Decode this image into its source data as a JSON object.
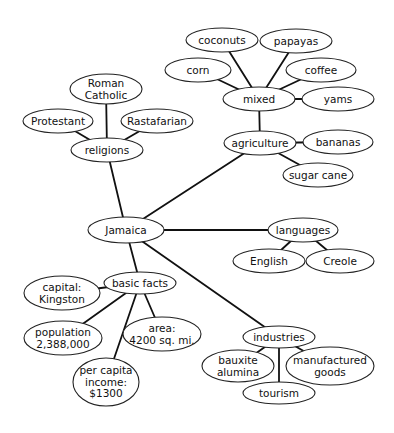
{
  "diagram": {
    "type": "concept-map",
    "root": "Jamaica",
    "nodes": [
      {
        "id": "jamaica",
        "lines": [
          "Jamaica"
        ],
        "cx": 126,
        "cy": 230,
        "rx": 38,
        "ry": 13
      },
      {
        "id": "religions",
        "lines": [
          "religions"
        ],
        "cx": 107,
        "cy": 150,
        "rx": 36,
        "ry": 12
      },
      {
        "id": "roman-catholic",
        "lines": [
          "Roman",
          "Catholic"
        ],
        "cx": 106,
        "cy": 89,
        "rx": 36,
        "ry": 15
      },
      {
        "id": "protestant",
        "lines": [
          "Protestant"
        ],
        "cx": 58,
        "cy": 121,
        "rx": 35,
        "ry": 12
      },
      {
        "id": "rastafarian",
        "lines": [
          "Rastafarian"
        ],
        "cx": 157,
        "cy": 121,
        "rx": 36,
        "ry": 12
      },
      {
        "id": "agriculture",
        "lines": [
          "agriculture"
        ],
        "cx": 260,
        "cy": 143,
        "rx": 36,
        "ry": 12
      },
      {
        "id": "mixed",
        "lines": [
          "mixed"
        ],
        "cx": 259,
        "cy": 99,
        "rx": 36,
        "ry": 12
      },
      {
        "id": "coconuts",
        "lines": [
          "coconuts"
        ],
        "cx": 222,
        "cy": 40,
        "rx": 36,
        "ry": 12
      },
      {
        "id": "papayas",
        "lines": [
          "papayas"
        ],
        "cx": 296,
        "cy": 41,
        "rx": 36,
        "ry": 12
      },
      {
        "id": "corn",
        "lines": [
          "corn"
        ],
        "cx": 198,
        "cy": 70,
        "rx": 33,
        "ry": 12
      },
      {
        "id": "coffee",
        "lines": [
          "coffee"
        ],
        "cx": 321,
        "cy": 70,
        "rx": 35,
        "ry": 12
      },
      {
        "id": "yams",
        "lines": [
          "yams"
        ],
        "cx": 338,
        "cy": 99,
        "rx": 36,
        "ry": 12
      },
      {
        "id": "bananas",
        "lines": [
          "bananas"
        ],
        "cx": 338,
        "cy": 142,
        "rx": 35,
        "ry": 12
      },
      {
        "id": "sugar-cane",
        "lines": [
          "sugar cane"
        ],
        "cx": 318,
        "cy": 175,
        "rx": 35,
        "ry": 12
      },
      {
        "id": "languages",
        "lines": [
          "languages"
        ],
        "cx": 303,
        "cy": 230,
        "rx": 35,
        "ry": 12
      },
      {
        "id": "english",
        "lines": [
          "English"
        ],
        "cx": 269,
        "cy": 261,
        "rx": 36,
        "ry": 12
      },
      {
        "id": "creole",
        "lines": [
          "Creole"
        ],
        "cx": 340,
        "cy": 261,
        "rx": 34,
        "ry": 12
      },
      {
        "id": "basic-facts",
        "lines": [
          "basic facts"
        ],
        "cx": 140,
        "cy": 283,
        "rx": 36,
        "ry": 11
      },
      {
        "id": "capital",
        "lines": [
          "capital:",
          "Kingston"
        ],
        "cx": 62,
        "cy": 293,
        "rx": 38,
        "ry": 17
      },
      {
        "id": "population",
        "lines": [
          "population",
          "2,388,000"
        ],
        "cx": 63,
        "cy": 338,
        "rx": 39,
        "ry": 17
      },
      {
        "id": "area",
        "lines": [
          "area:",
          "4200 sq. mi."
        ],
        "cx": 162,
        "cy": 334,
        "rx": 39,
        "ry": 17
      },
      {
        "id": "per-capita-income",
        "lines": [
          "per capita",
          "income:",
          "$1300"
        ],
        "cx": 106,
        "cy": 382,
        "rx": 33,
        "ry": 24
      },
      {
        "id": "industries",
        "lines": [
          "industries"
        ],
        "cx": 279,
        "cy": 337,
        "rx": 36,
        "ry": 11
      },
      {
        "id": "bauxite-alumina",
        "lines": [
          "bauxite",
          "alumina"
        ],
        "cx": 238,
        "cy": 366,
        "rx": 36,
        "ry": 16
      },
      {
        "id": "manufactured-goods",
        "lines": [
          "manufactured",
          "goods"
        ],
        "cx": 330,
        "cy": 366,
        "rx": 44,
        "ry": 19
      },
      {
        "id": "tourism",
        "lines": [
          "tourism"
        ],
        "cx": 279,
        "cy": 393,
        "rx": 36,
        "ry": 11
      }
    ],
    "edges": [
      [
        "jamaica",
        "religions"
      ],
      [
        "religions",
        "roman-catholic"
      ],
      [
        "religions",
        "protestant"
      ],
      [
        "religions",
        "rastafarian"
      ],
      [
        "jamaica",
        "agriculture"
      ],
      [
        "agriculture",
        "mixed"
      ],
      [
        "mixed",
        "coconuts"
      ],
      [
        "mixed",
        "papayas"
      ],
      [
        "mixed",
        "corn"
      ],
      [
        "mixed",
        "coffee"
      ],
      [
        "mixed",
        "yams"
      ],
      [
        "agriculture",
        "bananas"
      ],
      [
        "agriculture",
        "sugar-cane"
      ],
      [
        "jamaica",
        "languages"
      ],
      [
        "languages",
        "english"
      ],
      [
        "languages",
        "creole"
      ],
      [
        "jamaica",
        "basic-facts"
      ],
      [
        "basic-facts",
        "capital"
      ],
      [
        "basic-facts",
        "population"
      ],
      [
        "basic-facts",
        "area"
      ],
      [
        "basic-facts",
        "per-capita-income"
      ],
      [
        "jamaica",
        "industries"
      ],
      [
        "industries",
        "bauxite-alumina"
      ],
      [
        "industries",
        "manufactured-goods"
      ],
      [
        "industries",
        "tourism"
      ]
    ]
  }
}
